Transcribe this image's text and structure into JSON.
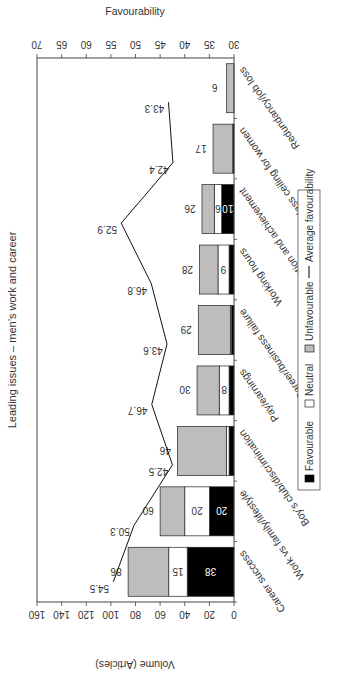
{
  "chart_data": {
    "type": "bar",
    "subtype": "stacked-bar-with-line",
    "orientation_note": "figure rotated 90 degrees counter-clockwise on page",
    "title": "Leading issues – men’s work and career",
    "xlabel": "",
    "ylabel": "Volume (Articles)",
    "ylabel_right": "Favourability",
    "ylim": [
      0,
      160
    ],
    "yticks": [
      0,
      20,
      40,
      60,
      80,
      100,
      120,
      140,
      160
    ],
    "ylim_right": [
      30,
      70
    ],
    "yticks_right": [
      30,
      35,
      40,
      45,
      50,
      55,
      60,
      65,
      70
    ],
    "grid": false,
    "legend_position": "bottom",
    "categories": [
      "Career success",
      "Work vs family/lifestyle",
      "Boy’s club/discrimination",
      "Pay/earnings",
      "Career/business failure",
      "Working hours",
      "Promotion and achievement",
      "Glass ceiling for women",
      "Redundancy/job loss"
    ],
    "series": [
      {
        "name": "Favourable",
        "type": "bar",
        "color": "#000000",
        "values": [
          38,
          20,
          4,
          4,
          2,
          4,
          10,
          1,
          0
        ]
      },
      {
        "name": "Neutral",
        "type": "bar",
        "color": "#ffffff",
        "values": [
          15,
          20,
          2,
          8,
          1,
          9,
          6,
          0,
          0
        ]
      },
      {
        "name": "Unfavourable",
        "type": "bar",
        "color": "#bdbdbd",
        "values": [
          33,
          20,
          40,
          18,
          26,
          15,
          10,
          16,
          6
        ]
      },
      {
        "name": "Average favourability",
        "type": "line",
        "axis": "right",
        "color": "#000000",
        "values": [
          54.5,
          50.3,
          42.5,
          46.7,
          43.6,
          46.8,
          52.9,
          42.4,
          43.3
        ]
      }
    ],
    "totals": [
      86,
      60,
      46,
      30,
      29,
      28,
      26,
      17,
      6
    ],
    "segment_labels": {
      "favourable": [
        "38",
        "20",
        "",
        "",
        "",
        "",
        "10",
        "",
        ""
      ],
      "neutral": [
        "15",
        "20",
        "",
        "8",
        "",
        "9",
        "6",
        "",
        ""
      ]
    }
  },
  "legend": {
    "items": [
      {
        "label": "Favourable",
        "swatch": "#000000"
      },
      {
        "label": "Neutral",
        "swatch": "#ffffff"
      },
      {
        "label": "Unfavourable",
        "swatch": "#bdbdbd"
      },
      {
        "label": "Average favourability",
        "swatch": "line"
      }
    ]
  }
}
